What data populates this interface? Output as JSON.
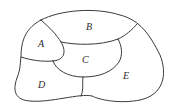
{
  "diagram": {
    "type": "planar-map-regions",
    "regions": [
      {
        "id": "A",
        "label": "A",
        "x": 41,
        "y": 47
      },
      {
        "id": "B",
        "label": "B",
        "x": 89,
        "y": 30
      },
      {
        "id": "C",
        "label": "C",
        "x": 85,
        "y": 63
      },
      {
        "id": "D",
        "label": "D",
        "x": 41,
        "y": 87
      },
      {
        "id": "E",
        "label": "E",
        "x": 126,
        "y": 79
      }
    ],
    "adjacencies": [
      [
        "A",
        "B"
      ],
      [
        "A",
        "C"
      ],
      [
        "A",
        "D"
      ],
      [
        "B",
        "C"
      ],
      [
        "B",
        "E"
      ],
      [
        "C",
        "D"
      ],
      [
        "C",
        "E"
      ],
      [
        "D",
        "E"
      ]
    ],
    "colors": {
      "stroke": "#3a3a3a",
      "label": "#2a2a2a",
      "background": "#ffffff"
    }
  }
}
